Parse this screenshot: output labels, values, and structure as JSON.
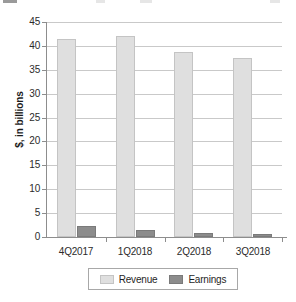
{
  "chart_data": {
    "type": "bar",
    "title": "",
    "xlabel": "",
    "ylabel": "$, in billions",
    "categories": [
      "4Q2017",
      "1Q2018",
      "2Q2018",
      "3Q2018"
    ],
    "series": [
      {
        "name": "Revenue",
        "values": [
          41.5,
          42.0,
          38.8,
          37.5
        ],
        "color": "#dfdfdf"
      },
      {
        "name": "Earnings",
        "values": [
          2.3,
          1.5,
          0.85,
          0.7
        ],
        "color": "#8c8c8c"
      }
    ],
    "ylim": [
      0,
      45
    ],
    "ytick_step": 5,
    "yticks": [
      0,
      5,
      10,
      15,
      20,
      25,
      30,
      35,
      40,
      45
    ],
    "ytick_labels": [
      "0",
      "5",
      "10",
      "15",
      "20",
      "25",
      "30",
      "35",
      "40",
      "45"
    ],
    "grid": "horizontal",
    "legend_position": "bottom",
    "legend_entries": [
      "Revenue",
      "Earnings"
    ]
  },
  "axes": {
    "y_axis_title": "$, in billions"
  },
  "legend": {
    "items": [
      {
        "label": "Revenue"
      },
      {
        "label": "Earnings"
      }
    ]
  }
}
